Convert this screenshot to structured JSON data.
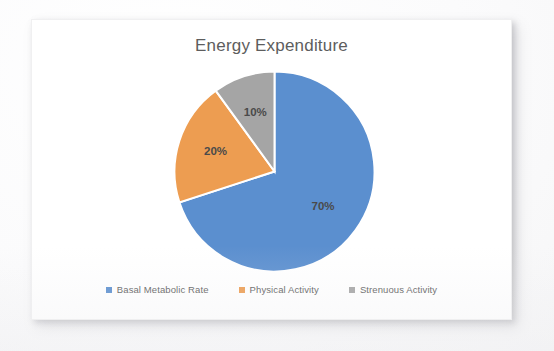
{
  "card": {
    "background_color": "#ffffff"
  },
  "chart_data": {
    "type": "pie",
    "title": "Energy Expenditure",
    "xlabel": "",
    "ylabel": "",
    "grid": false,
    "legend_position": "bottom",
    "start_angle_deg": 0,
    "direction": "clockwise",
    "categories": [
      "Basal Metabolic Rate",
      "Physical Activity",
      "Strenuous Activity"
    ],
    "values": [
      70,
      20,
      10
    ],
    "value_labels": [
      "70%",
      "20%",
      "10%"
    ],
    "colors": [
      "#5B8FCF",
      "#ED9D51",
      "#A5A5A5"
    ],
    "slices": [
      {
        "label": "Basal Metabolic Rate",
        "value": 70,
        "value_label": "70%",
        "color": "#5B8FCF",
        "start_deg": 0,
        "sweep_deg": 252
      },
      {
        "label": "Physical Activity",
        "value": 20,
        "value_label": "20%",
        "color": "#ED9D51",
        "start_deg": 252,
        "sweep_deg": 72
      },
      {
        "label": "Strenuous Activity",
        "value": 10,
        "value_label": "10%",
        "color": "#A5A5A5",
        "start_deg": 324,
        "sweep_deg": 36
      }
    ]
  },
  "title_color": "#5d5d5d",
  "label_color": "#4a4a4a",
  "legend_text_color": "#606060"
}
